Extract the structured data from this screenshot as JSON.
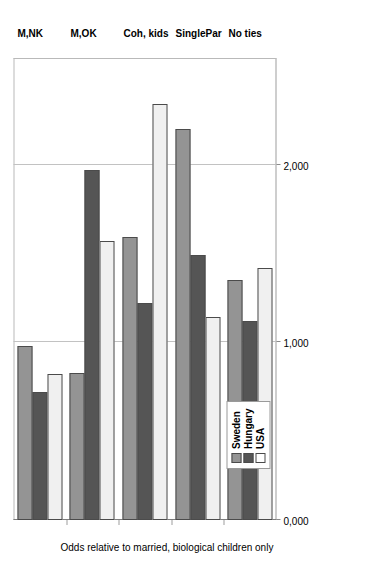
{
  "chart_data": {
    "type": "bar",
    "orientation": "horizontal",
    "title": "",
    "xlabel": "Odds relative to married, biological children only",
    "ylabel": "",
    "categories": [
      "M,NK",
      "M,OK",
      "Coh, kids",
      "SinglePar",
      "No ties"
    ],
    "series": [
      {
        "name": "Sweden",
        "color": "#949494",
        "values": [
          0.98,
          0.83,
          1.59,
          2.2,
          1.35
        ]
      },
      {
        "name": "Hungary",
        "color": "#555555",
        "values": [
          0.72,
          1.97,
          1.22,
          1.49,
          1.12
        ]
      },
      {
        "name": "USA",
        "color": "#f0f0f0",
        "values": [
          0.82,
          1.57,
          2.34,
          1.14,
          1.42
        ]
      }
    ],
    "xlim": [
      0,
      2.6
    ],
    "xticks": [
      "0,000",
      "1,000",
      "2,000"
    ],
    "xtick_values": [
      0,
      1,
      2
    ],
    "grid": true,
    "legend_position": "top-left-outside",
    "legend_entries": [
      "Sweden",
      "Hungary",
      "USA"
    ]
  },
  "legend": {
    "items": [
      {
        "label": "Sweden"
      },
      {
        "label": "Hungary"
      },
      {
        "label": "USA"
      }
    ]
  },
  "axis": {
    "title": "Odds relative to married, biological children only",
    "ticks": [
      "0,000",
      "1,000",
      "2,000"
    ]
  }
}
